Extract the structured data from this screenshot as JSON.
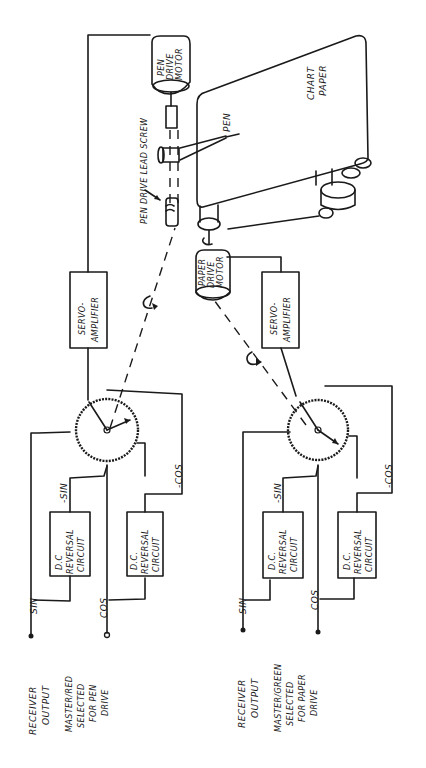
{
  "diagram": {
    "orientation": "rotated-90-ccw",
    "pen_channel": {
      "input_label_sin": "SIN",
      "input_label_cos": "COS",
      "receiver_label": [
        "RECEIVER",
        "OUTPUT"
      ],
      "selection_label": [
        "MASTER/RED",
        "SELECTED",
        "FOR PEN",
        "DRIVE"
      ],
      "neg_sin_label": "-SIN",
      "neg_cos_label": "-COS",
      "reversal_1": [
        "D.C",
        "REVERSAL",
        "CIRCUIT"
      ],
      "reversal_2": [
        "D.C.",
        "REVERSAL",
        "CIRCUIT"
      ],
      "servo": [
        "SERVO-",
        "AMPLIFIER"
      ],
      "motor": [
        "PEN",
        "DRIVE",
        "MOTOR"
      ],
      "lead_screw_label": "PEN DRIVE LEAD SCREW"
    },
    "paper_channel": {
      "input_label_sin": "SIN",
      "input_label_cos": "COS",
      "receiver_label": [
        "RECEIVER",
        "OUTPUT"
      ],
      "selection_label": [
        "MASTER/GREEN",
        "SELECTED",
        "FOR PAPER",
        "DRIVE"
      ],
      "neg_sin_label": "-SIN",
      "neg_cos_label": "-COS",
      "reversal_1": [
        "D.C.",
        "REVERSAL",
        "CIRCUIT"
      ],
      "reversal_2": [
        "D.C.",
        "REVERSAL",
        "CIRCUIT"
      ],
      "servo": [
        "SERVO-",
        "AMPLIFIER"
      ],
      "motor": [
        "PAPER",
        "DRIVE",
        "MOTOR"
      ]
    },
    "recorder": {
      "pen_label": "PEN",
      "chart_label": [
        "CHART",
        "PAPER"
      ]
    },
    "colors": {
      "ink": "#1a1a1a",
      "paper": "#ffffff"
    }
  }
}
